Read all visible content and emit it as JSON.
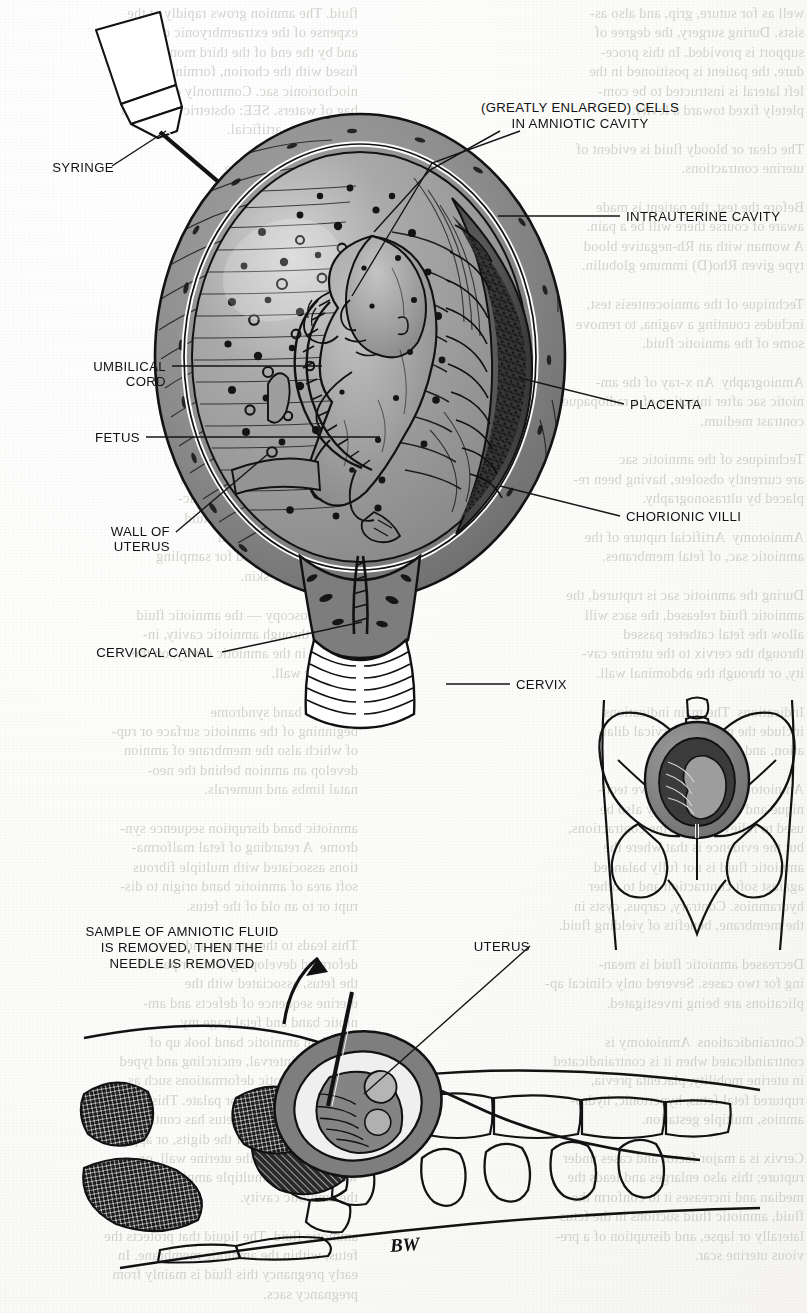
{
  "figure": {
    "artist_signature": "BW",
    "signature_2": "BW"
  },
  "labels": {
    "syringe": "SYRINGE",
    "cells_line1": "(GREATLY ENLARGED) CELLS",
    "cells_line2": "IN AMNIOTIC CAVITY",
    "intrauterine_cavity": "INTRAUTERINE CAVITY",
    "umbilical_cord_line1": "UMBILICAL",
    "umbilical_cord_line2": "CORD",
    "placenta": "PLACENTA",
    "fetus": "FETUS",
    "chorionic_villi": "CHORIONIC VILLI",
    "wall_of_uterus_line1": "WALL OF",
    "wall_of_uterus_line2": "UTERUS",
    "cervical_canal": "CERVICAL CANAL",
    "cervix": "CERVIX",
    "sample_line1": "SAMPLE OF AMNIOTIC FLUID",
    "sample_line2": "IS REMOVED, THEN THE",
    "sample_line3": "NEEDLE IS REMOVED",
    "uterus": "UTERUS"
  },
  "colors": {
    "ink": "#121212",
    "paper": "#fdfdfc",
    "uterine_wall": "#8d8d8d",
    "uterine_wall_dark": "#6e6e6e",
    "amniotic_fluid": "#9a9a9a",
    "fetus_body": "#a8a8a8",
    "villi_dark": "#2e2e2e",
    "bleed_text": "#b9b9b5"
  },
  "bleedthrough": {
    "left_column": "fluid. The amnion grows rapidly at the\nexpense of the extraembryonic coelom,\nand by the end of the third month it is\nfused with the chorion, forming the am-\nniochorionic sac. Commonly called the\nbag of waters. SEE: obstetric rupture of\nmembranes, artificial.\n\nKaufman over syringe\nrepresents 1 to 6 inches\nposition in the part of\nfused with the chorionic\nmixation of the cord\nthese are mainly as-\nsociated with adipokeratins\n(FIGURE) — see ampli-\nfied. See also: amniotic fluid,\nclear fluid. The am-\nniotic cells. By ca-\npalpating to the umbili-\ncal cord, draining the amni-\notic fluid.\n\nendoscope that allows a\ncheck of the colloid is held in\nand of the fetal scalp. Charac-\nteristics of the amniotic fluid\nby pressing against and\nwill use a clear field for sampling\nand taking the skin.\n\nSEE: fetoscopy — the amniotic fluid\nreaches through amniotic cavity, in-\nserted it in the amniotic cavity, on the\nposterior wall.\n\namniotic band syndrome\nbeginning of the amniotic surface or rup-\nof which also the membrane of amnion\ndevelop an amnion behind the neo-\nnatal limbs and numerals.\n\namniotic band disruption sequence syn-\ndrome  A retarding of fetal malforma-\ntions associated with multiple fibrous\nsoft area of amniotic band origin to dis-\nrupt or to an old of the fetus.\n\nThis leads to the amnion and to a \ndeformed developing fetus or part of\nthe fetus, associated with the\nuterine sequence of defects and am-\nniotic band and fetal page my\nreveal an amniotic band look up of\ndecreased interval, encircling and typed\nand the amniotic deformations such as\nclubfoot or cleft lip or palate. This is\nsuspected when the fetus has contrac-\ntures, particularly of the digits, or appears\nto be adherent to the uterine wall, or\nwhen there are multiple amniotic septa in\nthe amniotic cavity.\n\namniotic fluid  The liquid that protects the\nfetus, within the amniotic membrane. In\nearly pregnancy this fluid is mainly from\npregnancy sacs.",
    "right_column": "well as for suture, grip, and also as-\nsists. During surgery, the degree of\nsupport is provided. In this proce-\ndure, the patient is positioned in the\nleft lateral is instructed to be com-\npletely fixed toward a levity.\n\nThe clear or bloody fluid is evident of\nuterine contractions.\n\nBefore the test, the patient is made\naware of course there will be a pain.\nA woman with an Rh-negative blood\ntype given Rho(D) immune globulin.\n\nTechnique of the amniocentesis test,\nincludes counting a vagina, to remove\nsome of the amniotic fluid.\n\nAmniography  An x-ray of the am-\nniotic sac after injection of a radiopaque\ncontrast medium.\n\nTechniques of the amniotic sac\nare currently obsolete, having been re-\nplaced by ultrasonography.\n\nAmniotomy  Artificial rupture of the\namniotic sac, of fetal membranes.\n\nDuring the amniotic sac is ruptured, the\namniotic fluid released, the sacs will\nallow the fetal catheter passed\nthrough the cervix to the uterine cav-\nity, or through the abdominal wall.\n\nIndications  The main indications\ninclude the need for cervical dilat-\nation, and urgent delivery.\n\nAmniotomy is a noninvasive tech-\nnique and therefore it may also be\nused to relieve the uterine contractions,\nbut the evidence is that where the\namniotic fluid is not fully balanced\nagainst soft contraction and to other\nhydramnios. Contrary, carpus, cysts in\nthe membrane, benefits of yielding fluid.\n\nDecreased amniotic fluid is mean-\ning for two cases. Severed only clinical ap-\nplications are being investigated.\n\nContraindications  Amniotomy is\ncontraindicated when it is contraindicated\nin uterine mobility, placenta previa,\nruptured fetal fetus, hypertonic, hydro-\namnios, multiple gestation.\n\nCervix is a major factor and cases under\nrupture; this also enlarges and leads the\nmedian and increases it to conform the\nfluid, amniotic fluid suctions in the fetus\nlaterally or lapse, and disruption of a pre-\nvious uterine scar."
  }
}
